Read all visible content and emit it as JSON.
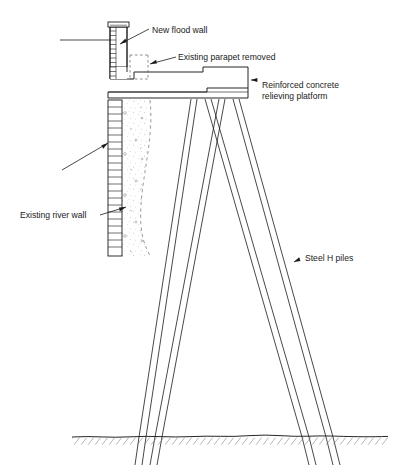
{
  "figure": {
    "type": "engineering-cross-section",
    "background_color": "#ffffff",
    "line_color": "#1a1a1a",
    "text_color": "#1a1a1a"
  },
  "labels": [
    {
      "id": "new-flood-wall",
      "text": "New flood wall",
      "x": 152,
      "y": 30,
      "lines": [
        "New flood wall"
      ]
    },
    {
      "id": "existing-parapet-removed",
      "text": "Existing parapet removed",
      "x": 178,
      "y": 57,
      "lines": [
        "Existing parapet removed"
      ]
    },
    {
      "id": "reinforced-concrete-relieving-platform",
      "text": "Reinforced concrete relieving platform",
      "x": 260,
      "y": 88,
      "lines": [
        "Reinforced concrete",
        "relieving platform"
      ]
    },
    {
      "id": "existing-river-wall",
      "text": "Existing river wall",
      "x": 22,
      "y": 215,
      "lines": [
        "Existing river wall"
      ]
    },
    {
      "id": "steel-h-piles",
      "text": "Steel H piles",
      "x": 303,
      "y": 257,
      "lines": [
        "Steel H piles"
      ]
    }
  ],
  "components": {
    "new_flood_wall": {
      "name": "new-flood-wall",
      "description": "Masonry flood wall with coping cap, course hatching on face",
      "top_y": 22,
      "bottom_y": 97,
      "left_x": 110,
      "right_x": 128,
      "course_count": 12
    },
    "existing_parapet_removed": {
      "name": "existing-parapet-removed",
      "description": "Former parapet shown dashed to indicate demolition",
      "x": 130,
      "y": 55,
      "width": 18,
      "height": 25,
      "line_style": "dashed"
    },
    "relieving_platform": {
      "name": "reinforced-concrete-relieving-platform",
      "description": "Stepped reinforced concrete slab spanning from flood wall to riverward edge",
      "top_y": 67,
      "bottom_y": 98,
      "left_x": 110,
      "right_x": 248
    },
    "existing_river_wall": {
      "name": "existing-river-wall",
      "description": "Existing masonry river wall with stippled mass concrete backing",
      "top_y": 100,
      "bottom_y": 256,
      "left_x": 108,
      "right_x": 122,
      "course_count": 22
    },
    "mass_concrete_fill": {
      "name": "mass-concrete-fill",
      "description": "Stippled concrete fill behind river wall bounded by curved dashed line",
      "texture": "stipple"
    },
    "steel_h_piles": {
      "name": "steel-h-piles",
      "description": "Two pairs of raking steel H piles forming A-frame beneath the platform",
      "pile_count": 4,
      "head_y": 99,
      "toe_y": 465
    },
    "ground_line": {
      "name": "ground-line",
      "description": "Undulating existing ground surface with hatching below",
      "y": 437,
      "x_start": 72,
      "x_end": 388
    }
  }
}
